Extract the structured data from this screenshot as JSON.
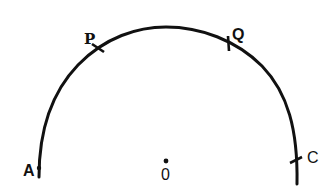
{
  "diagram": {
    "type": "circular-arc-with-marked-points",
    "colors": {
      "stroke": "#111111",
      "background": "#ffffff"
    },
    "center": {
      "label": "0",
      "x": 166,
      "y": 161
    },
    "arc": {
      "start_point": "A",
      "end_point": "C",
      "radius_px": 133
    },
    "points": [
      {
        "label": "A",
        "x": 39,
        "y": 168,
        "mark": "dot"
      },
      {
        "label": "P",
        "x": 98,
        "y": 48,
        "mark": "tick"
      },
      {
        "label": "Q",
        "x": 230,
        "y": 42,
        "mark": "tick"
      },
      {
        "label": "C",
        "x": 295,
        "y": 180,
        "mark": "tick"
      }
    ]
  }
}
